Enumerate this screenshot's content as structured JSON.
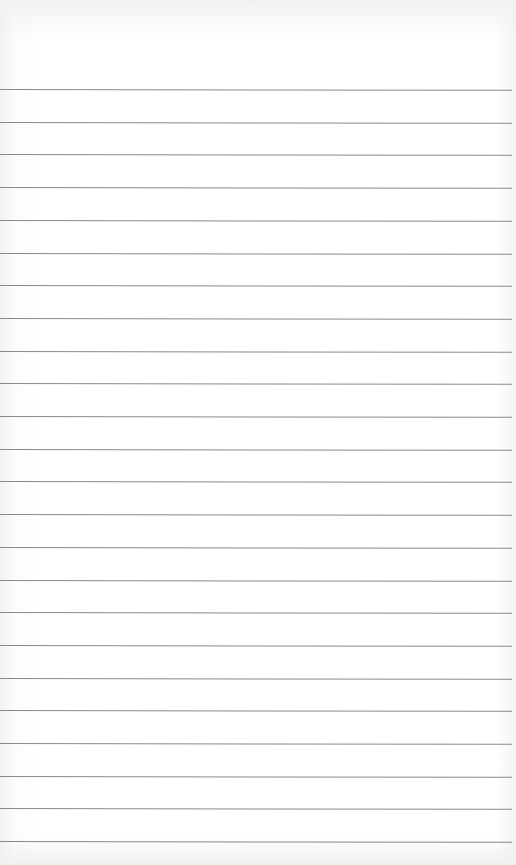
{
  "paper": {
    "type": "lined-paper",
    "background_color": "#ffffff",
    "rule_color": "#8a8a8a",
    "rule_count": 24,
    "first_rule_y": 89,
    "rule_spacing": 32.7
  }
}
